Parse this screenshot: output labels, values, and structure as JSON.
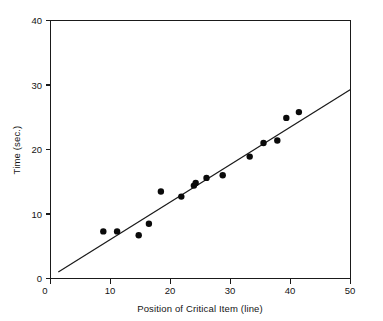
{
  "chart_data": {
    "type": "scatter",
    "title": "",
    "xlabel": "Position of Critical Item (line)",
    "ylabel": "Time (sec.)",
    "xlim": [
      0,
      50
    ],
    "ylim": [
      0,
      40
    ],
    "xticks": [
      0,
      10,
      20,
      30,
      40,
      50
    ],
    "yticks": [
      0,
      10,
      20,
      30,
      40
    ],
    "xtick_labels": [
      "0",
      "10",
      "20",
      "30",
      "40",
      "50"
    ],
    "ytick_labels": [
      "0",
      "10",
      "20",
      "30",
      "40"
    ],
    "grid": false,
    "legend": false,
    "marker": "filled-circle",
    "marker_color": "#0a0a0a",
    "line_color": "#1a1a1a",
    "points": [
      {
        "x": 8.8,
        "y": 7.3
      },
      {
        "x": 11.1,
        "y": 7.3
      },
      {
        "x": 14.7,
        "y": 6.7
      },
      {
        "x": 16.4,
        "y": 8.5
      },
      {
        "x": 18.4,
        "y": 13.5
      },
      {
        "x": 21.8,
        "y": 12.7
      },
      {
        "x": 23.9,
        "y": 14.4
      },
      {
        "x": 24.2,
        "y": 14.8
      },
      {
        "x": 26.0,
        "y": 15.6
      },
      {
        "x": 28.7,
        "y": 16.0
      },
      {
        "x": 33.2,
        "y": 18.9
      },
      {
        "x": 35.5,
        "y": 21.0
      },
      {
        "x": 37.8,
        "y": 21.4
      },
      {
        "x": 39.3,
        "y": 24.9
      },
      {
        "x": 41.4,
        "y": 25.8
      }
    ],
    "fit_line": {
      "x_start": 1.3,
      "y_start": 1.0,
      "x_end": 50.0,
      "y_end": 29.3,
      "slope": 0.581,
      "intercept": 0.245
    }
  },
  "axes": {
    "x_axis_name": "x-axis",
    "y_axis_name": "y-axis"
  }
}
